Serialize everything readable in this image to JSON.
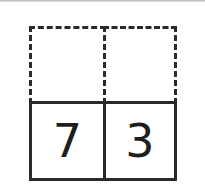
{
  "diagram": {
    "type": "place-value-grid",
    "rows": 2,
    "columns": 2,
    "top_row": {
      "style": "dashed",
      "cells": [
        "",
        ""
      ]
    },
    "bottom_row": {
      "style": "solid",
      "cells": [
        "7",
        "3"
      ]
    },
    "colors": {
      "line": "#2a2a2a",
      "digit": "#1e1e1e",
      "background": "#ffffff"
    }
  }
}
